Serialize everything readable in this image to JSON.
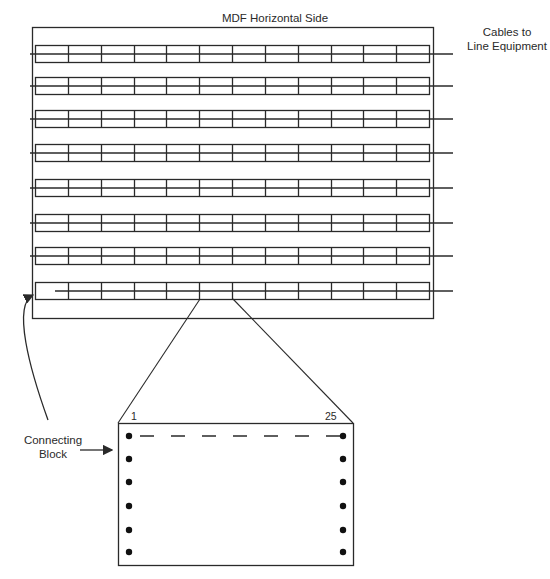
{
  "diagram": {
    "title": "MDF Horizontal Side",
    "cables_label_line1": "Cables to",
    "cables_label_line2": "Line Equipment",
    "connecting_block_label_line1": "Connecting",
    "connecting_block_label_line2": "Block",
    "block_first_pin": "1",
    "block_last_pin": "25",
    "strip_count": 8,
    "cells_per_strip": 12,
    "pin_rows_per_side": 6,
    "colors": {
      "line": "#2a2a2a",
      "background": "#ffffff"
    }
  }
}
